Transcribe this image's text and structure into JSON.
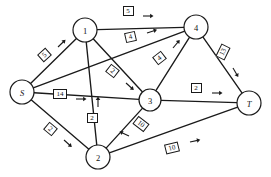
{
  "figure": {
    "kind": "network-flow-graph",
    "background_color": "#ffffff",
    "line_color": "#1a1a1a"
  },
  "chart_data": {
    "type": "diagram",
    "title": "",
    "xlabel": "",
    "ylabel": "",
    "nodes": [
      {
        "id": "S",
        "label": "S",
        "x": 22,
        "y": 92,
        "r": 12,
        "italic": true
      },
      {
        "id": "1",
        "label": "1",
        "x": 85,
        "y": 30,
        "r": 12,
        "italic": false
      },
      {
        "id": "4",
        "label": "4",
        "x": 196,
        "y": 27,
        "r": 12,
        "italic": false
      },
      {
        "id": "3",
        "label": "3",
        "x": 150,
        "y": 100,
        "r": 11,
        "italic": false
      },
      {
        "id": "2",
        "label": "2",
        "x": 98,
        "y": 157,
        "r": 12,
        "italic": false
      },
      {
        "id": "T",
        "label": "T",
        "x": 249,
        "y": 103,
        "r": 12,
        "italic": true
      }
    ],
    "edges": [
      {
        "from": "S",
        "to": "1",
        "capacity": "5",
        "label_x": 44,
        "label_y": 55,
        "rotation": -42,
        "arrow_angle": -44,
        "arrow_x": 58,
        "arrow_y": 47,
        "box": "w1"
      },
      {
        "from": "S",
        "to": "4",
        "capacity": "4",
        "label_x": 130,
        "label_y": 37,
        "rotation": -13,
        "arrow_angle": -18,
        "arrow_x": 147,
        "arrow_y": 33,
        "box": "w1"
      },
      {
        "from": "S",
        "to": "3",
        "capacity": "14",
        "label_x": 60,
        "label_y": 94,
        "rotation": 0,
        "arrow_angle": 0,
        "arrow_x": 76,
        "arrow_y": 99,
        "box": "w2"
      },
      {
        "from": "S",
        "to": "2",
        "capacity": "2",
        "label_x": 50,
        "label_y": 129,
        "rotation": 40,
        "arrow_angle": 42,
        "arrow_x": 64,
        "arrow_y": 140,
        "box": "w1"
      },
      {
        "from": "1",
        "to": "4",
        "capacity": "5",
        "label_x": 128,
        "label_y": 11,
        "rotation": 0,
        "arrow_angle": 0,
        "arrow_x": 143,
        "arrow_y": 16,
        "box": "w1"
      },
      {
        "from": "1",
        "to": "3",
        "capacity": "2",
        "label_x": 112,
        "label_y": 71,
        "rotation": 38,
        "arrow_angle": 42,
        "arrow_x": 126,
        "arrow_y": 83,
        "box": "w1"
      },
      {
        "from": "2",
        "to": "1",
        "capacity": "2",
        "label_x": 92,
        "label_y": 118,
        "rotation": 0,
        "arrow_angle": -90,
        "arrow_x": 98,
        "arrow_y": 107,
        "box": "w1"
      },
      {
        "from": "3",
        "to": "4",
        "capacity": "4",
        "label_x": 159,
        "label_y": 58,
        "rotation": -38,
        "arrow_angle": -50,
        "arrow_x": 173,
        "arrow_y": 48,
        "box": "w1"
      },
      {
        "from": "3",
        "to": "2",
        "capacity": "10",
        "label_x": 141,
        "label_y": 124,
        "rotation": 38,
        "arrow_angle": 205,
        "arrow_x": 129,
        "arrow_y": 136,
        "box": "w2"
      },
      {
        "from": "3",
        "to": "T",
        "capacity": "2",
        "label_x": 196,
        "label_y": 88,
        "rotation": 0,
        "arrow_angle": 0,
        "arrow_x": 212,
        "arrow_y": 93,
        "box": "w1"
      },
      {
        "from": "4",
        "to": "T",
        "capacity": "13",
        "label_x": 223,
        "label_y": 52,
        "rotation": -64,
        "arrow_angle": 60,
        "arrow_x": 233,
        "arrow_y": 68,
        "box": "w2"
      },
      {
        "from": "2",
        "to": "T",
        "capacity": "10",
        "label_x": 172,
        "label_y": 148,
        "rotation": -14,
        "arrow_angle": -12,
        "arrow_x": 190,
        "arrow_y": 142,
        "box": "w2"
      }
    ]
  }
}
